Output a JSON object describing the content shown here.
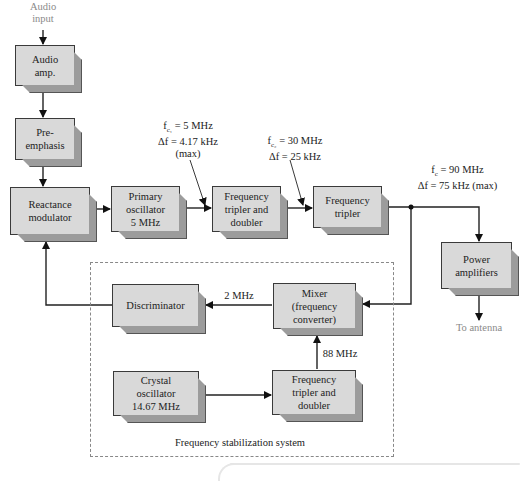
{
  "diagram": {
    "type": "block-diagram",
    "input_label_line1": "Audio",
    "input_label_line2": "input",
    "output_label": "To antenna",
    "blocks": {
      "audio_amp": {
        "line1": "Audio",
        "line2": "amp."
      },
      "pre_emphasis": {
        "line1": "Pre-",
        "line2": "emphasis"
      },
      "reactance_modulator": {
        "line1": "Reactance",
        "line2": "modulator"
      },
      "primary_oscillator": {
        "line1": "Primary",
        "line2": "oscillator",
        "line3": "5 MHz"
      },
      "freq_tripler_doubler_top": {
        "line1": "Frequency",
        "line2": "tripler and",
        "line3": "doubler"
      },
      "freq_tripler": {
        "line1": "Frequency",
        "line2": "tripler"
      },
      "power_amplifiers": {
        "line1": "Power",
        "line2": "amplifiers"
      },
      "discriminator": {
        "line1": "Discriminator"
      },
      "mixer": {
        "line1": "Mixer",
        "line2": "(frequency",
        "line3": "converter)"
      },
      "crystal_oscillator": {
        "line1": "Crystal",
        "line2": "oscillator",
        "line3": "14.67 MHz"
      },
      "freq_tripler_doubler_bottom": {
        "line1": "Frequency",
        "line2": "tripler and",
        "line3": "doubler"
      }
    },
    "annotations": {
      "a1": {
        "fc_sym": "f",
        "fc_sub": "c₁",
        "fc_val": " = 5 MHz",
        "df": "Δf = 4.17 kHz",
        "extra": "(max)"
      },
      "a2": {
        "fc_sym": "f",
        "fc_sub": "c₂",
        "fc_val": " = 30 MHz",
        "df": "Δf = 25 kHz"
      },
      "a3": {
        "fc_sym": "f",
        "fc_sub": "c",
        "fc_val": " = 90 MHz",
        "df": "Δf = 75 kHz (max)"
      },
      "mixer_out": "2 MHz",
      "mixer_in": "88 MHz"
    },
    "subsystem_label": "Frequency stabilization system",
    "colors": {
      "block_face": "#d9d9d9",
      "block_side": "#9c9c9c",
      "line": "#222222",
      "dashed": "#888888",
      "gray_text": "#8a8a8a"
    }
  }
}
